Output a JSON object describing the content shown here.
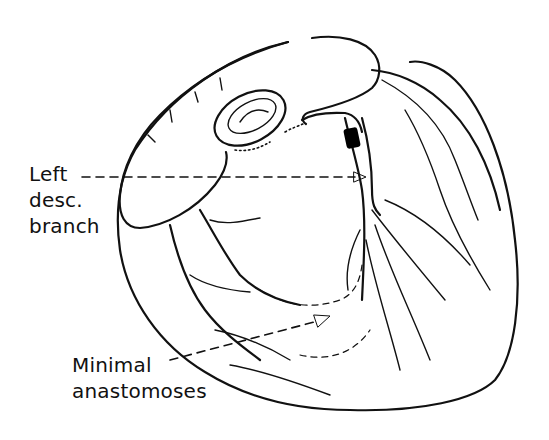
{
  "figure": {
    "colors": {
      "ink": "#111111",
      "background": "#ffffff",
      "occlusion": "#000000"
    }
  },
  "labels": {
    "left_descending_branch": {
      "lines": [
        "Left",
        "desc.",
        "branch"
      ]
    },
    "minimal_anastomoses": {
      "lines": [
        "Minimal",
        "anastomoses"
      ]
    }
  },
  "annotations": [
    {
      "type": "dashed-arrow",
      "from_label": "left_descending_branch",
      "target": "left anterior descending artery below occlusion"
    },
    {
      "type": "dashed-arrow",
      "from_label": "minimal_anastomoses",
      "target": "anastomotic vessels near apex"
    },
    {
      "type": "occlusion-block",
      "location": "proximal left anterior descending artery"
    }
  ]
}
